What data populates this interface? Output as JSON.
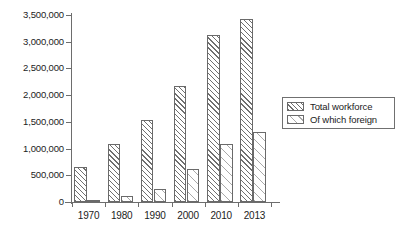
{
  "chart_data": {
    "type": "bar",
    "title": "",
    "subtitle": "",
    "xlabel": "",
    "ylabel": "",
    "categories": [
      "1970",
      "1980",
      "1990",
      "2000",
      "2010",
      "2013"
    ],
    "series": [
      {
        "name": "Total workforce",
        "values": [
          650000,
          1080000,
          1530000,
          2180000,
          3130000,
          3430000
        ]
      },
      {
        "name": "Of which foreign",
        "values": [
          10000,
          120000,
          240000,
          610000,
          1080000,
          1310000
        ]
      }
    ],
    "ylim": [
      0,
      3500000
    ],
    "ytick_values": [
      0,
      500000,
      1000000,
      1500000,
      2000000,
      2500000,
      3000000,
      3500000
    ],
    "ytick_labels": [
      "0",
      "500,000",
      "1,000,000",
      "1,500,000",
      "2,000,000",
      "2,500,000",
      "3,000,000",
      "3,500,000"
    ],
    "grid": false,
    "legend_position": "right",
    "legend_entries": [
      "Total workforce",
      "Of which foreign"
    ],
    "colors": {
      "axis": "#6d6d6d",
      "text": "#1c1c1c",
      "total_hatch": "#6f6f6f",
      "foreign_hatch": "#a9a9a9",
      "bar_outline": "#6a6a6a",
      "background": "#ffffff"
    }
  }
}
